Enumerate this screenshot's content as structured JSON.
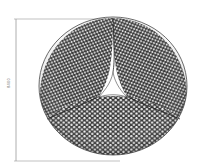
{
  "figure": {
    "dimension_label": "8400",
    "colors": {
      "mesh_stroke": "#333333",
      "cell_fill": "#ffffff",
      "dimension_line": "#999999"
    }
  }
}
